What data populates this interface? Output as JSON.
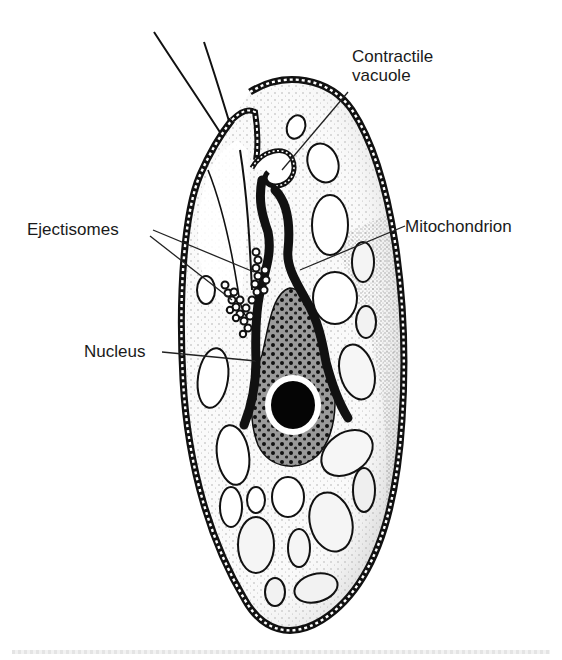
{
  "figure": {
    "background": "#ffffff",
    "ink_color": "#111111"
  },
  "labels": {
    "contractile_vacuole": [
      "Contractile",
      "vacuole"
    ],
    "mitochondrion": "Mitochondrion",
    "ejectisomes": "Ejectisomes",
    "nucleus": "Nucleus"
  },
  "label_text": {
    "contractile_line1": "Contractile",
    "contractile_line2": "vacuole",
    "mitochondrion": "Mitochondrion",
    "ejectisomes": "Ejectisomes",
    "nucleus": "Nucleus"
  },
  "structures": [
    "flagella (2)",
    "cell periplast (beaded outline)",
    "gullet / furrow",
    "contractile vacuole",
    "mitochondrion (elongate, dark)",
    "ejectisomes (bead chain)",
    "nucleus with dark nucleolus",
    "plastid/starch vesicles (ovals)"
  ]
}
